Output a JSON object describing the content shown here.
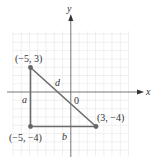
{
  "axes": {
    "x_label": "x",
    "y_label": "y",
    "origin_label": "0",
    "grid": true,
    "x_range": [
      -7,
      7
    ],
    "y_range": [
      -7,
      7
    ]
  },
  "points": [
    {
      "name": "A",
      "x": -5,
      "y": 3,
      "label": "(−5, 3)"
    },
    {
      "name": "B",
      "x": -5,
      "y": -4,
      "label": "(−5, −4)"
    },
    {
      "name": "C",
      "x": 3,
      "y": -4,
      "label": "(3, −4)"
    }
  ],
  "segments": [
    {
      "from": "A",
      "to": "B",
      "label": "a"
    },
    {
      "from": "B",
      "to": "C",
      "label": "b"
    },
    {
      "from": "A",
      "to": "C",
      "label": "d"
    }
  ],
  "colors": {
    "triangle": "#6b6b6b",
    "grid": "#e4e4e4",
    "axis": "#444444"
  }
}
